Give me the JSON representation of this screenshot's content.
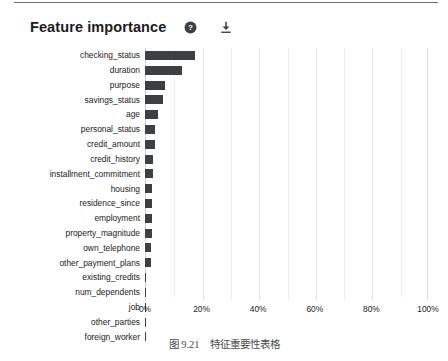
{
  "card": {
    "title": "Feature importance",
    "icons": [
      {
        "name": "help-icon",
        "label": "?"
      },
      {
        "name": "download-icon",
        "label": ""
      }
    ]
  },
  "caption": {
    "number": "图 9.21",
    "text": "特征重要性表格"
  },
  "chart_data": {
    "type": "bar",
    "orientation": "horizontal",
    "title": "Feature importance",
    "xlabel": "",
    "ylabel": "",
    "xlim": [
      0,
      100
    ],
    "unit": "%",
    "grid": true,
    "legend": null,
    "bar_color": "#3c4043",
    "categories": [
      "checking_status",
      "duration",
      "purpose",
      "savings_status",
      "age",
      "personal_status",
      "credit_amount",
      "credit_history",
      "installment_commitment",
      "housing",
      "residence_since",
      "employment",
      "property_magnitude",
      "own_telephone",
      "other_payment_plans",
      "existing_credits",
      "num_dependents",
      "job",
      "other_parties",
      "foreign_worker"
    ],
    "values": [
      17.5,
      13.0,
      7.0,
      6.3,
      4.5,
      3.6,
      3.4,
      2.9,
      2.8,
      2.6,
      2.5,
      2.5,
      2.4,
      2.2,
      2.1,
      0.4,
      0.3,
      0.3,
      0.2,
      0.2
    ],
    "xticks": [
      0,
      20,
      40,
      60,
      80,
      100
    ],
    "xticklabels": [
      "0%",
      "20%",
      "40%",
      "60%",
      "80%",
      "100%"
    ],
    "minor_xticks": [
      10,
      30,
      50,
      70,
      90
    ]
  }
}
